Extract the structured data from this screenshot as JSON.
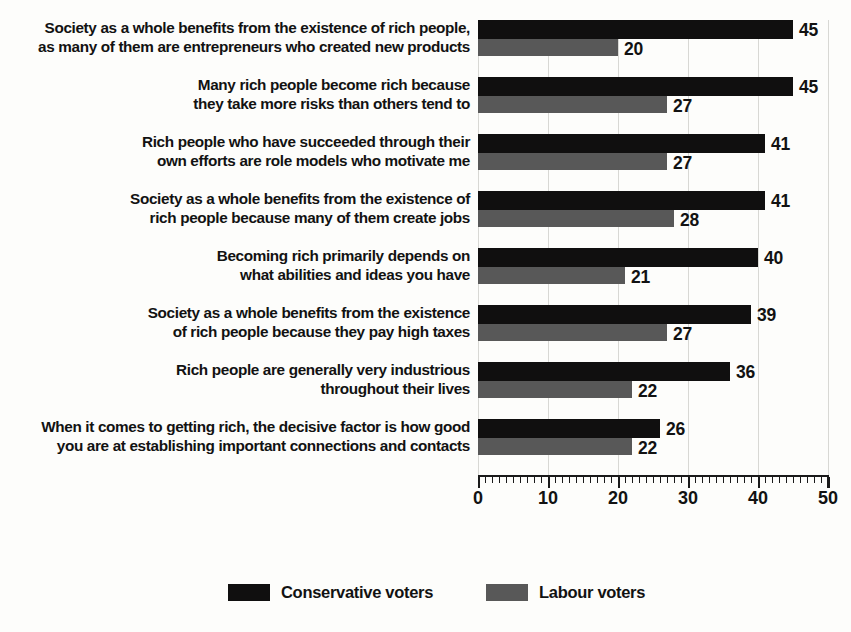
{
  "chart_data": {
    "type": "bar",
    "orientation": "horizontal",
    "title": "",
    "subtitle": "",
    "xlabel": "",
    "ylabel": "",
    "xlim": [
      0,
      50
    ],
    "xticks": [
      0,
      10,
      20,
      30,
      40,
      50
    ],
    "xtick_labels": [
      "0",
      "10",
      "20",
      "30",
      "40",
      "50"
    ],
    "minor_tick_step": 1,
    "grid": true,
    "legend_position": "bottom",
    "categories": [
      "Society as a whole benefits from the existence of rich people, as many of them are entrepreneurs who created new products",
      "Many rich people become rich because they take more risks than others tend to",
      "Rich people who have succeeded through their own efforts are role models who motivate me",
      "Society as a whole benefits from the existence of rich people because many of them create jobs",
      "Becoming rich primarily depends on what abilities and ideas you have",
      "Society as a whole benefits from the existence of rich people because they pay high taxes",
      "Rich people are generally very industrious throughout their lives",
      "When it comes to getting rich, the decisive factor is how good you are at establishing important connections and contacts"
    ],
    "category_lines": [
      [
        "Society as a whole benefits from the existence of rich people,",
        "as many of them are entrepreneurs who created new products"
      ],
      [
        "Many rich people become rich because",
        "they take more risks than others tend to"
      ],
      [
        "Rich people who have succeeded through their",
        "own efforts are role models who motivate me"
      ],
      [
        "Society as a whole benefits from the existence of",
        "rich people because many of them create jobs"
      ],
      [
        "Becoming rich primarily depends on",
        "what abilities and ideas you have"
      ],
      [
        "Society as a whole benefits from the existence",
        "of rich people because they pay high taxes"
      ],
      [
        "Rich people are generally very industrious",
        "throughout their lives"
      ],
      [
        "When it comes to getting rich, the decisive factor is how good",
        "you are at establishing important connections and contacts"
      ]
    ],
    "series": [
      {
        "name": "Conservative voters",
        "color": "#100f0f",
        "values": [
          45,
          45,
          41,
          41,
          40,
          39,
          36,
          26
        ],
        "value_labels": [
          "45",
          "45",
          "41",
          "41",
          "40",
          "39",
          "36",
          "26"
        ]
      },
      {
        "name": "Labour voters",
        "color": "#585858",
        "values": [
          20,
          27,
          27,
          28,
          21,
          27,
          22,
          22
        ],
        "value_labels": [
          "20",
          "27",
          "27",
          "28",
          "21",
          "27",
          "22",
          "22"
        ]
      }
    ]
  },
  "legend": {
    "items": [
      {
        "label": "Conservative voters",
        "color": "#100f0f"
      },
      {
        "label": "Labour voters",
        "color": "#585858"
      }
    ]
  }
}
